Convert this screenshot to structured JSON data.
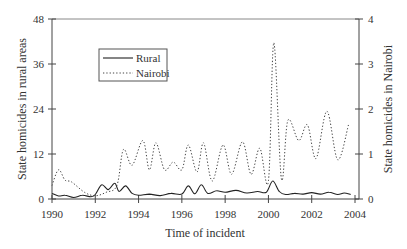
{
  "chart_data": {
    "type": "line",
    "title": "",
    "xlabel": "Time of incident",
    "ylabel": "State homicides in rural areas",
    "ylabel_right": "State homicides in Nairobi",
    "xlim": [
      1990,
      2004
    ],
    "ylim": [
      0,
      48
    ],
    "ylim_right": [
      0,
      4
    ],
    "x_ticks": [
      1990,
      1992,
      1994,
      1996,
      1998,
      2000,
      2002,
      2004
    ],
    "y_ticks": [
      0,
      12,
      24,
      36,
      48
    ],
    "y_ticks_right": [
      0,
      1,
      2,
      3,
      4
    ],
    "grid": false,
    "legend_position": "upper left",
    "legend": [
      "Rural",
      "Nairobi"
    ],
    "series": [
      {
        "name": "Rural",
        "axis": "left",
        "style": "solid",
        "x": [
          1990.0,
          1990.3,
          1990.6,
          1991.0,
          1991.4,
          1991.8,
          1992.0,
          1992.3,
          1992.6,
          1992.9,
          1993.1,
          1993.4,
          1993.7,
          1994.0,
          1994.5,
          1995.0,
          1995.5,
          1996.0,
          1996.3,
          1996.6,
          1996.9,
          1997.2,
          1997.6,
          1998.0,
          1998.5,
          1999.0,
          1999.5,
          1999.9,
          2000.2,
          2000.5,
          2000.8,
          2001.2,
          2001.6,
          2002.0,
          2002.4,
          2002.8,
          2003.2,
          2003.5,
          2003.8
        ],
        "values": [
          1.5,
          0.8,
          1.0,
          0.4,
          1.0,
          0.6,
          1.2,
          3.8,
          2.5,
          4.2,
          2.0,
          3.5,
          1.5,
          1.0,
          1.3,
          0.9,
          1.5,
          1.3,
          3.5,
          1.4,
          3.8,
          1.5,
          2.2,
          1.8,
          2.3,
          1.6,
          2.0,
          1.8,
          4.8,
          2.0,
          1.2,
          1.5,
          1.3,
          1.7,
          1.3,
          1.8,
          1.2,
          1.6,
          1.2
        ]
      },
      {
        "name": "Nairobi",
        "axis": "right",
        "style": "dotted",
        "x": [
          1990.0,
          1990.3,
          1990.6,
          1990.9,
          1991.5,
          1992.0,
          1992.5,
          1993.0,
          1993.3,
          1993.7,
          1994.2,
          1994.5,
          1994.8,
          1995.2,
          1995.6,
          1996.0,
          1996.3,
          1996.7,
          1997.0,
          1997.4,
          1997.9,
          1998.3,
          1998.8,
          1999.2,
          1999.6,
          2000.0,
          2000.25,
          2000.6,
          2000.9,
          2001.4,
          2001.8,
          2002.2,
          2002.7,
          2003.2,
          2003.7
        ],
        "values": [
          0.3,
          0.65,
          0.42,
          0.38,
          0.15,
          0.07,
          0.15,
          0.3,
          1.1,
          0.75,
          1.3,
          0.65,
          1.25,
          0.65,
          0.82,
          0.65,
          1.2,
          0.6,
          1.25,
          0.4,
          1.2,
          0.55,
          1.27,
          0.55,
          1.13,
          0.4,
          3.47,
          0.45,
          1.75,
          1.3,
          1.65,
          0.9,
          1.95,
          0.87,
          1.65
        ]
      }
    ]
  }
}
